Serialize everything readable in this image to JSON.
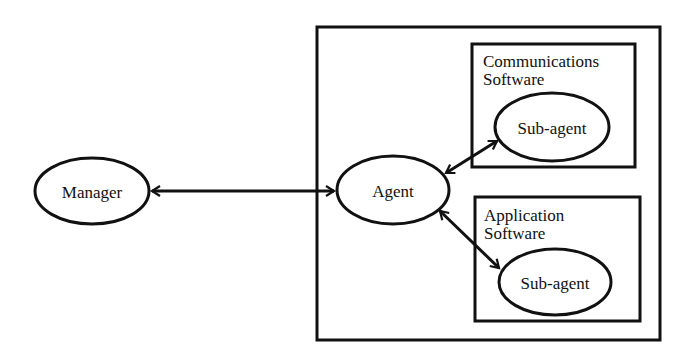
{
  "diagram": {
    "nodes": {
      "manager": {
        "label": "Manager"
      },
      "agent": {
        "label": "Agent"
      },
      "comms_box": {
        "title_line1": "Communications",
        "title_line2": "Software"
      },
      "comms_subagent": {
        "label": "Sub-agent"
      },
      "app_box": {
        "title_line1": "Application",
        "title_line2": "Software"
      },
      "app_subagent": {
        "label": "Sub-agent"
      }
    },
    "edges": [
      {
        "from": "Manager",
        "to": "Agent",
        "type": "bidirectional"
      },
      {
        "from": "Agent",
        "to": "Sub-agent (Communications Software)",
        "type": "bidirectional"
      },
      {
        "from": "Agent",
        "to": "Sub-agent (Application Software)",
        "type": "bidirectional"
      }
    ],
    "colors": {
      "stroke": "#111111",
      "background": "#ffffff"
    }
  }
}
